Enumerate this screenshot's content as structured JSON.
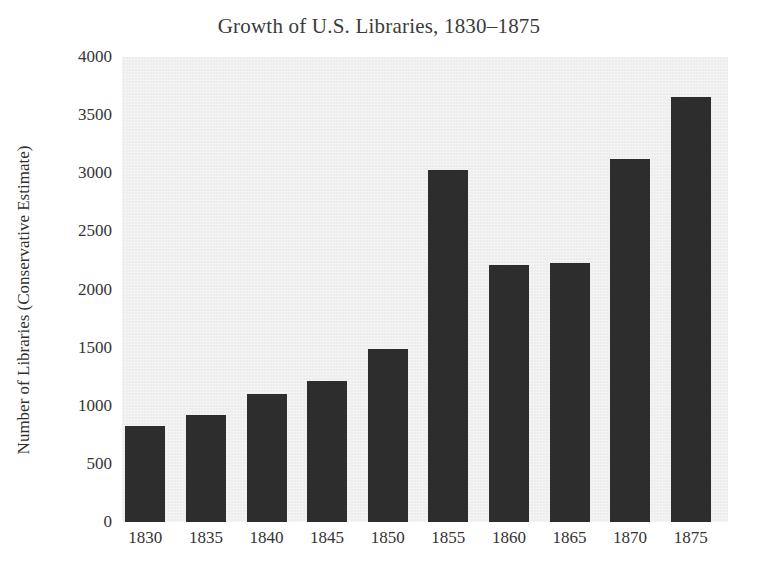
{
  "chart_data": {
    "type": "bar",
    "title": "Growth of U.S. Libraries, 1830–1875",
    "xlabel": "",
    "ylabel": "Number of Libraries (Conservative Estimate)",
    "categories": [
      "1830",
      "1835",
      "1840",
      "1845",
      "1850",
      "1855",
      "1860",
      "1865",
      "1870",
      "1875"
    ],
    "values": [
      830,
      920,
      1100,
      1210,
      1490,
      3030,
      2210,
      2230,
      3120,
      3660
    ],
    "ylim": [
      0,
      4000
    ],
    "ytick_labels": [
      "4000",
      "3500",
      "3000",
      "2500",
      "2000",
      "1500",
      "1000",
      "500",
      "0"
    ],
    "ytick_values": [
      4000,
      3500,
      3000,
      2500,
      2000,
      1500,
      1000,
      500,
      0
    ],
    "grid": false,
    "legend": false,
    "bar_color": "#2d2d2d",
    "plot_background": "#ededed",
    "figure_background": "#ffffff",
    "text_color": "#343434"
  }
}
